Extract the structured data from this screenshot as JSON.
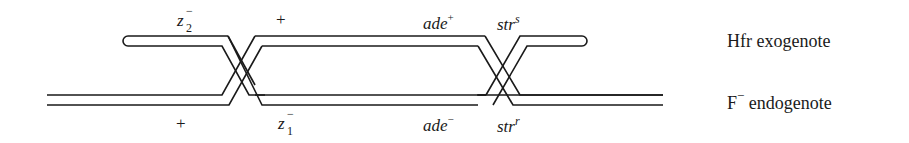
{
  "diagram": {
    "type": "genetic-crossover",
    "colors": {
      "line": "#1a1a1a",
      "background": "#ffffff"
    },
    "strands": [
      {
        "id": "hfr",
        "name": "Hfr exogenote"
      },
      {
        "id": "f_minus",
        "name_prefix": "F",
        "name_sup": "−",
        "name_suffix": " endogenote"
      }
    ],
    "top_labels": {
      "z2": {
        "base": "z",
        "sub": "2",
        "sup": "−"
      },
      "plus": "+",
      "ade": {
        "base": "ade",
        "sup": "+"
      },
      "str": {
        "base": "str",
        "sup": "s"
      }
    },
    "bottom_labels": {
      "plus": "+",
      "z1": {
        "base": "z",
        "sub": "1",
        "sup": "−"
      },
      "ade": {
        "base": "ade",
        "sup": "−"
      },
      "str": {
        "base": "str",
        "sup": "r"
      }
    },
    "right_labels": {
      "hfr": "Hfr exogenote",
      "f_prefix": "F",
      "f_sup": "−",
      "f_suffix": " endogenote"
    }
  }
}
